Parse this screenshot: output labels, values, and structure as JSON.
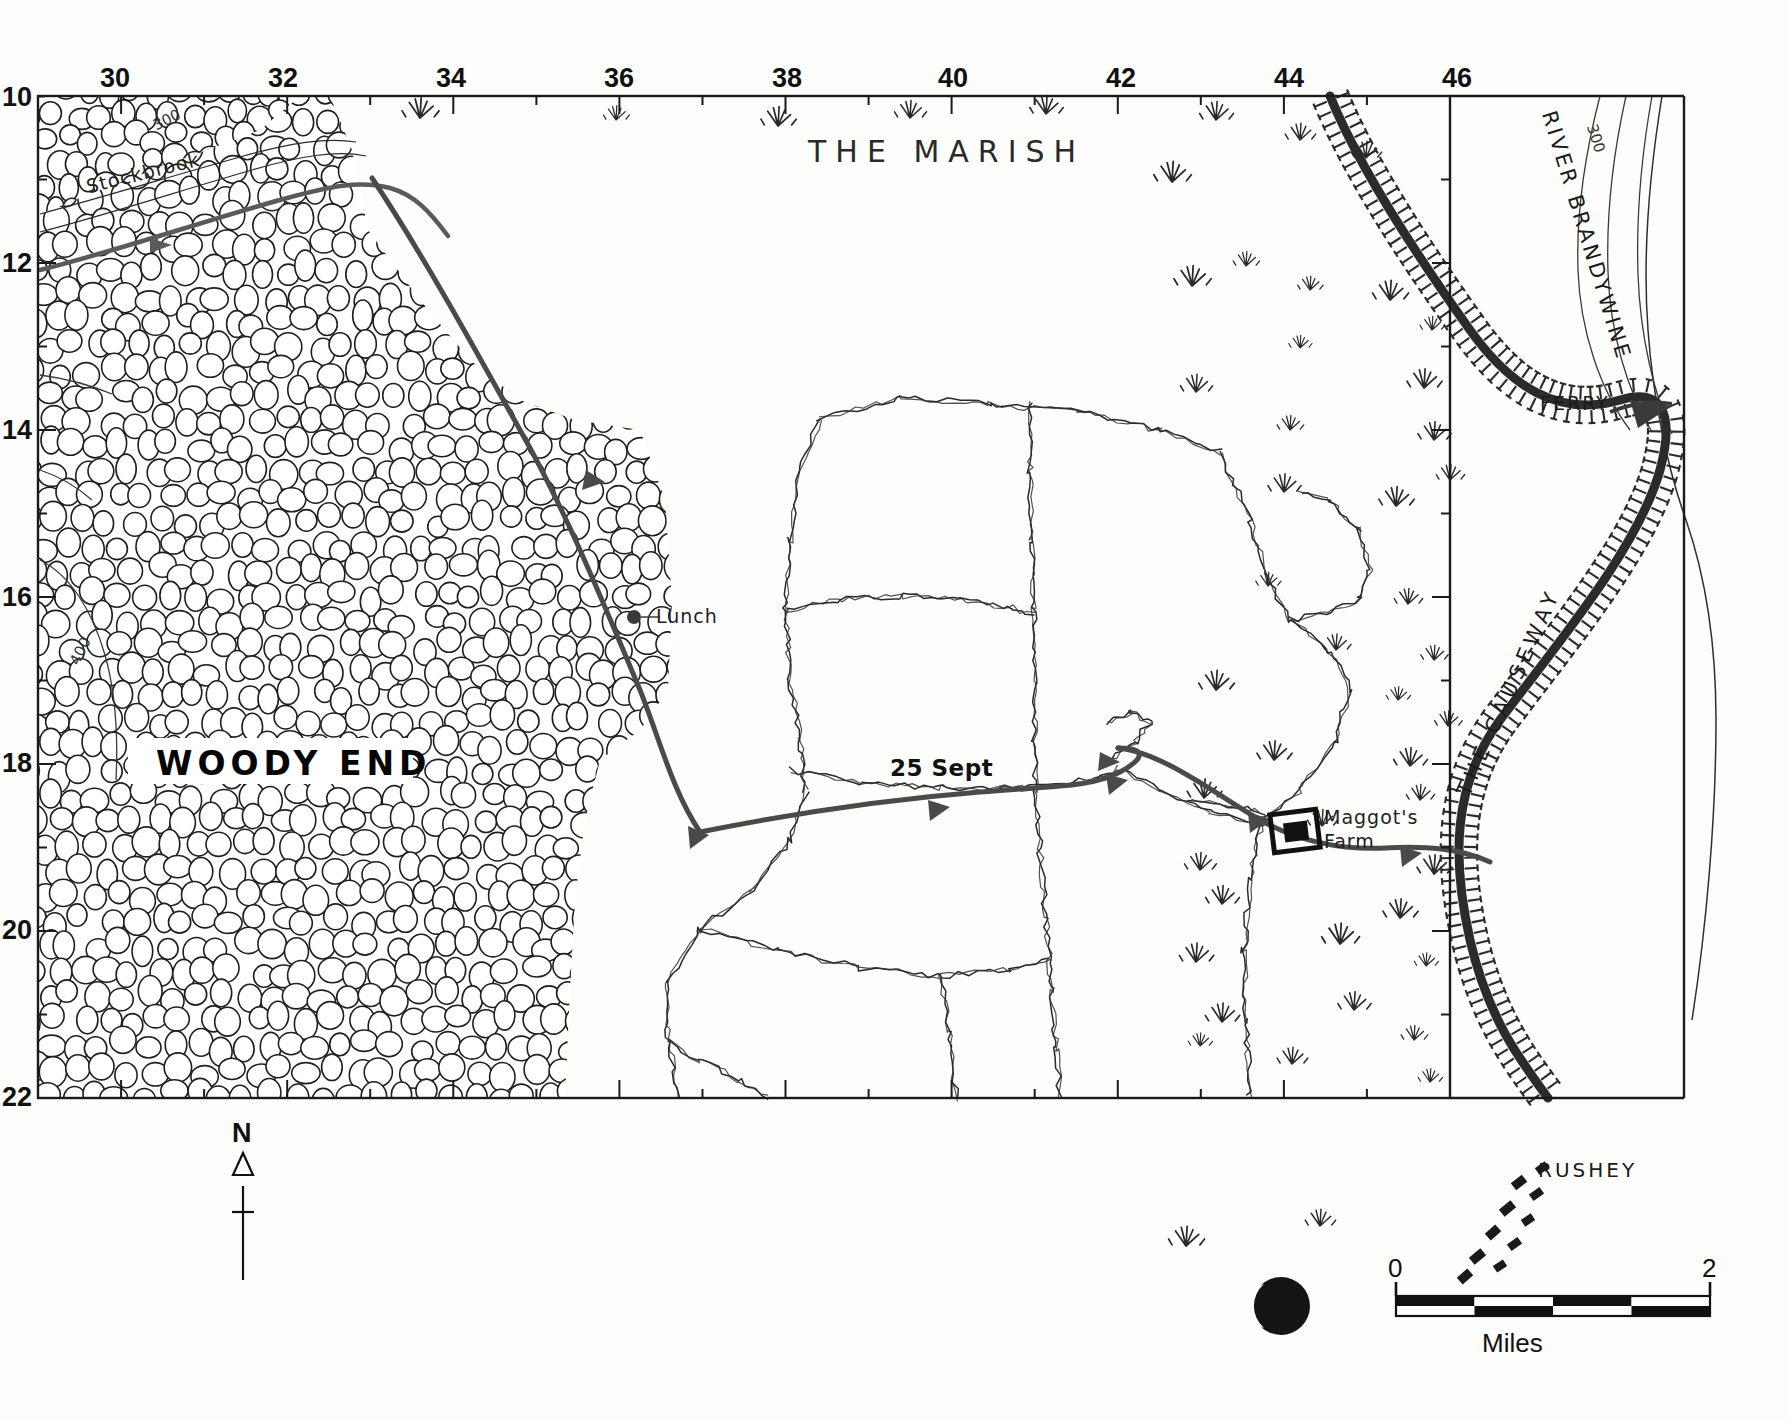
{
  "map": {
    "title_area": "THE MARISH",
    "grid": {
      "x_labels": [
        "30",
        "32",
        "34",
        "36",
        "38",
        "40",
        "42",
        "44",
        "46"
      ],
      "y_labels": [
        "10",
        "12",
        "14",
        "16",
        "18",
        "20",
        "22"
      ],
      "x_min": 29,
      "x_max": 46,
      "y_min": 10,
      "y_max": 22
    },
    "labels": {
      "marish": "THE MARISH",
      "woody_end": "WOODY END",
      "stockbrook": "Stockbrook",
      "river_brandywine": "RIVER BRANDYWINE",
      "ferry": "FERRY",
      "the_causeway": "THE CAUSEWAY",
      "rushey": "RUSHEY",
      "maggots_farm_line1": "Maggot's",
      "maggots_farm_line2": "Farm",
      "lunch": "Lunch",
      "date_stop": "25 Sept",
      "contour_300": "300",
      "contour_400": "400",
      "contour_300b": "300"
    },
    "legend": {
      "north_letter": "N",
      "scale_zero": "0",
      "scale_two": "2",
      "scale_units": "Miles"
    },
    "colors": {
      "ink": "#1a1a1a",
      "route": "#4a4a4a",
      "water": "#5a5a5a",
      "paper": "#fdfdfc",
      "causeway": "#2b2b2b"
    }
  },
  "chart_data": {
    "type": "map",
    "title": "THE MARISH",
    "grid_x_ticks": [
      30,
      32,
      34,
      36,
      38,
      40,
      42,
      44,
      46
    ],
    "grid_y_ticks": [
      10,
      12,
      14,
      16,
      18,
      20,
      22
    ],
    "annotations": [
      {
        "text": "THE MARISH",
        "grid": [
          38.6,
          10.8
        ],
        "kind": "region-label"
      },
      {
        "text": "WOODY END",
        "grid": [
          31.8,
          16.9
        ],
        "kind": "region-label"
      },
      {
        "text": "Stockbrook",
        "grid": [
          30.3,
          11.0
        ],
        "kind": "water-label"
      },
      {
        "text": "RIVER BRANDYWINE",
        "grid": [
          45.2,
          11.8
        ],
        "kind": "water-label"
      },
      {
        "text": "FERRY",
        "grid": [
          44.7,
          12.9
        ],
        "kind": "place"
      },
      {
        "text": "THE CAUSEWAY",
        "grid": [
          44.1,
          16.0
        ],
        "kind": "route-label"
      },
      {
        "text": "RUSHEY",
        "grid": [
          44.7,
          20.9
        ],
        "kind": "place"
      },
      {
        "text": "Maggot's Farm",
        "grid": [
          42.3,
          17.4
        ],
        "kind": "place"
      },
      {
        "text": "Lunch",
        "grid": [
          35.6,
          15.2
        ],
        "kind": "route-stop"
      },
      {
        "text": "25 Sept",
        "grid": [
          37.6,
          16.9
        ],
        "kind": "date-stop"
      },
      {
        "text": "300",
        "grid": [
          45.1,
          10.5
        ],
        "kind": "contour"
      },
      {
        "text": "400",
        "grid": [
          29.5,
          15.9
        ],
        "kind": "contour"
      },
      {
        "text": "300",
        "grid": [
          29.8,
          10.4
        ],
        "kind": "contour"
      }
    ],
    "scale_bar": {
      "from": 0,
      "to": 2,
      "units": "Miles",
      "segments": 4
    },
    "north_arrow": true,
    "moon_phase": "waning-crescent"
  }
}
